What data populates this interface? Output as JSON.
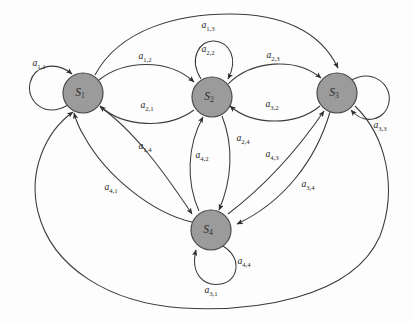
{
  "figure": {
    "type": "state-transition-diagram",
    "title": "",
    "background_color": "#fdfdfd",
    "node_fill_color": "#9b9b9b",
    "node_stroke_color": "#4a4a4a",
    "edge_color": "#3a3a3a"
  },
  "nodes": [
    {
      "id": "S1",
      "label_main": "S",
      "label_sub": "1",
      "cx": 83,
      "cy": 93,
      "r": 20
    },
    {
      "id": "S2",
      "label_main": "S",
      "label_sub": "2",
      "cx": 212,
      "cy": 97,
      "r": 20
    },
    {
      "id": "S3",
      "label_main": "S",
      "label_sub": "3",
      "cx": 337,
      "cy": 93,
      "r": 20
    },
    {
      "id": "S4",
      "label_main": "S",
      "label_sub": "4",
      "cx": 211,
      "cy": 230,
      "r": 20
    }
  ],
  "edges": [
    {
      "id": "a11",
      "from": "S1",
      "to": "S1",
      "label_main": "a",
      "label_sub": "1,1",
      "lx": 39,
      "ly": 64,
      "kind": "self-loop"
    },
    {
      "id": "a22",
      "from": "S2",
      "to": "S2",
      "label_main": "a",
      "label_sub": "2,2",
      "lx": 208,
      "ly": 50,
      "kind": "self-loop"
    },
    {
      "id": "a33",
      "from": "S3",
      "to": "S3",
      "label_main": "a",
      "label_sub": "3,3",
      "lx": 380,
      "ly": 126,
      "kind": "self-loop"
    },
    {
      "id": "a44",
      "from": "S4",
      "to": "S4",
      "label_main": "a",
      "label_sub": "4,4",
      "lx": 244,
      "ly": 262,
      "kind": "self-loop"
    },
    {
      "id": "a12",
      "from": "S1",
      "to": "S2",
      "label_main": "a",
      "label_sub": "1,2",
      "lx": 145,
      "ly": 57,
      "kind": "arc"
    },
    {
      "id": "a21",
      "from": "S2",
      "to": "S1",
      "label_main": "a",
      "label_sub": "2,1",
      "lx": 147,
      "ly": 106,
      "kind": "arc"
    },
    {
      "id": "a23",
      "from": "S2",
      "to": "S3",
      "label_main": "a",
      "label_sub": "2,3",
      "lx": 273,
      "ly": 56,
      "kind": "arc"
    },
    {
      "id": "a32",
      "from": "S3",
      "to": "S2",
      "label_main": "a",
      "label_sub": "3,2",
      "lx": 272,
      "ly": 105,
      "kind": "arc"
    },
    {
      "id": "a13",
      "from": "S1",
      "to": "S3",
      "label_main": "a",
      "label_sub": "1,3",
      "lx": 208,
      "ly": 26,
      "kind": "long-arc"
    },
    {
      "id": "a31",
      "from": "S3",
      "to": "S1",
      "label_main": "a",
      "label_sub": "3,1",
      "lx": 211,
      "ly": 291,
      "kind": "long-arc"
    },
    {
      "id": "a14",
      "from": "S1",
      "to": "S4",
      "label_main": "a",
      "label_sub": "1,4",
      "lx": 145,
      "ly": 147,
      "kind": "arc"
    },
    {
      "id": "a41",
      "from": "S4",
      "to": "S1",
      "label_main": "a",
      "label_sub": "4,1",
      "lx": 111,
      "ly": 188,
      "kind": "arc"
    },
    {
      "id": "a24",
      "from": "S2",
      "to": "S4",
      "label_main": "a",
      "label_sub": "2,4",
      "lx": 243,
      "ly": 139,
      "kind": "arc"
    },
    {
      "id": "a42",
      "from": "S4",
      "to": "S2",
      "label_main": "a",
      "label_sub": "4,2",
      "lx": 202,
      "ly": 156,
      "kind": "arc"
    },
    {
      "id": "a34",
      "from": "S3",
      "to": "S4",
      "label_main": "a",
      "label_sub": "3,4",
      "lx": 308,
      "ly": 185,
      "kind": "arc"
    },
    {
      "id": "a43",
      "from": "S4",
      "to": "S3",
      "label_main": "a",
      "label_sub": "4,3",
      "lx": 272,
      "ly": 155,
      "kind": "arc"
    }
  ]
}
